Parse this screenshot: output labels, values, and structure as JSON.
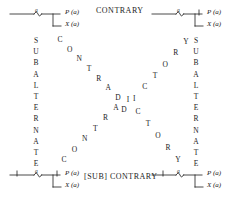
{
  "diagram": {
    "captions": {
      "top": "CONTRARY",
      "bottom": "[SUB] CONTRARY"
    },
    "sides": {
      "left_label": "SUBALTERNATE",
      "right_label": "SUBALTERNATE"
    },
    "diagonal_label": "CONTRADICTORY",
    "corners": [
      {
        "id": "top-left",
        "position": "A",
        "tick_count": 0,
        "arg_label": "a",
        "predicate": "P (a)",
        "variable": "X (a)"
      },
      {
        "id": "top-right",
        "position": "E",
        "tick_count": 1,
        "arg_label": "a",
        "predicate": "P (a)",
        "variable": "X (a)"
      },
      {
        "id": "bottom-left",
        "position": "I",
        "tick_count": 2,
        "arg_label": "a",
        "predicate": "P (a)",
        "variable": "X (a)"
      },
      {
        "id": "bottom-right",
        "position": "O",
        "tick_count": 1,
        "arg_label": "a",
        "predicate": "P (a)",
        "variable": "X (a)"
      }
    ],
    "diagonals": {
      "top_left_to_center": [
        "C",
        "O",
        "N",
        "T",
        "R",
        "A",
        "D"
      ],
      "center_to_bottom_right": [
        "I",
        "C",
        "T",
        "O",
        "R",
        "Y"
      ],
      "bottom_left_to_center": [
        "C",
        "O",
        "N",
        "T",
        "R",
        "A"
      ],
      "center_to_top_right": [
        "D",
        "I",
        "C",
        "T",
        "O",
        "R",
        "Y"
      ]
    },
    "colors": {
      "ink": "#1c1c1c",
      "background": "#ffffff"
    }
  }
}
